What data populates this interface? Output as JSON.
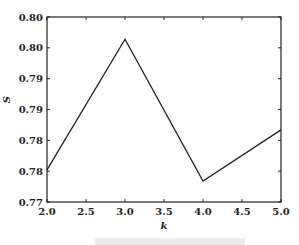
{
  "chart_data": {
    "type": "line",
    "title": "",
    "xlabel": "k",
    "ylabel": "S",
    "xlim": [
      2.0,
      5.0
    ],
    "ylim": [
      0.77,
      0.8
    ],
    "x_ticks": [
      "2.0",
      "2.5",
      "3.0",
      "3.5",
      "4.0",
      "4.5",
      "5.0"
    ],
    "y_ticks": [
      "0.77",
      "0.78",
      "0.78",
      "0.79",
      "0.79",
      "0.80",
      "0.80"
    ],
    "y_tick_values": [
      0.77,
      0.775,
      0.78,
      0.785,
      0.79,
      0.795,
      0.8
    ],
    "grid": false,
    "legend": null,
    "series": [
      {
        "name": "S",
        "x": [
          2.0,
          3.0,
          4.0,
          5.0
        ],
        "values": [
          0.7752,
          0.7964,
          0.7734,
          0.7817
        ],
        "color": "#222222"
      }
    ]
  },
  "layout": {
    "plot": {
      "left": 47,
      "right": 281,
      "top": 17,
      "bottom": 202
    }
  }
}
